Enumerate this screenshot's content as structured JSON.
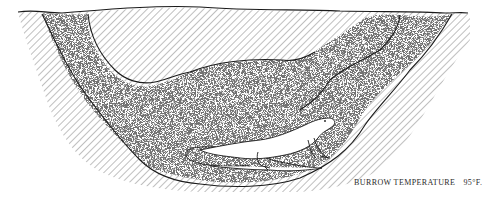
{
  "figure": {
    "caption": {
      "label": "BURROW TEMPERATURE",
      "value": "95°F."
    },
    "elements": {
      "soil": "diagonal-hatched earth",
      "tunnels": "two stippled entrance tunnels (left and right)",
      "chamber": "stippled oval chamber at the bottom",
      "animal": "lizard outline"
    },
    "colors": {
      "ink": "#1a1a1a",
      "hatch": "#6a6a6a",
      "paper": "#ffffff"
    }
  }
}
